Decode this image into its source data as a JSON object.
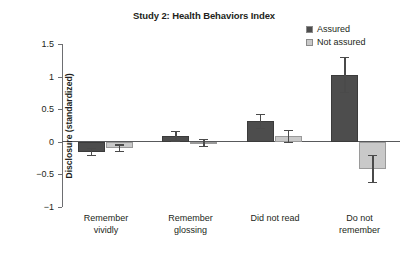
{
  "chart_data": {
    "type": "bar",
    "title": "Study 2: Health Behaviors Index",
    "xlabel": "",
    "ylabel": "Disclosure (standardized)",
    "ylim": [
      -1,
      1.5
    ],
    "ytick_labels": [
      "1.5",
      "1",
      "0.5",
      "0",
      "-0.5",
      "-1"
    ],
    "ytick_values": [
      1.5,
      1,
      0.5,
      0,
      -0.5,
      -1
    ],
    "grid": false,
    "legend_position": "top-right",
    "categories": [
      "Remember vividly",
      "Remember glossing",
      "Did not read",
      "Do not remember"
    ],
    "category_lines": [
      [
        "Remember",
        "vividly"
      ],
      [
        "Remember",
        "glossing"
      ],
      [
        "Did not read",
        ""
      ],
      [
        "Do not",
        "remember"
      ]
    ],
    "series": [
      {
        "name": "Assured",
        "color": "#4d4d4d",
        "values": [
          -0.15,
          0.09,
          0.32,
          1.03
        ],
        "errors": [
          0.05,
          0.07,
          0.11,
          0.27
        ]
      },
      {
        "name": "Not assured",
        "color": "#c9c9c9",
        "values": [
          -0.09,
          -0.01,
          0.09,
          -0.41
        ],
        "errors": [
          0.05,
          0.06,
          0.09,
          0.21
        ]
      }
    ]
  },
  "legend": {
    "items": [
      {
        "label": "Assured",
        "color": "#4d4d4d"
      },
      {
        "label": "Not assured",
        "color": "#c9c9c9"
      }
    ]
  }
}
